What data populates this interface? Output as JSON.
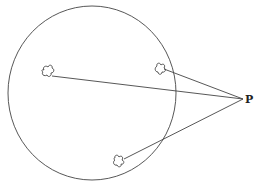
{
  "diagram": {
    "point_label": "P",
    "colors": {
      "stroke": "#444444",
      "background": "#ffffff"
    },
    "circle": {
      "cx": 92,
      "cy": 93,
      "rx": 84,
      "ry": 87
    },
    "point": {
      "x": 243,
      "y": 99
    },
    "objects": [
      {
        "name": "left-blob",
        "x": 48,
        "y": 73,
        "inside": true
      },
      {
        "name": "upper-right-blob",
        "x": 161,
        "y": 69,
        "inside": true
      },
      {
        "name": "lower-blob",
        "x": 120,
        "y": 161,
        "inside": true
      }
    ]
  }
}
